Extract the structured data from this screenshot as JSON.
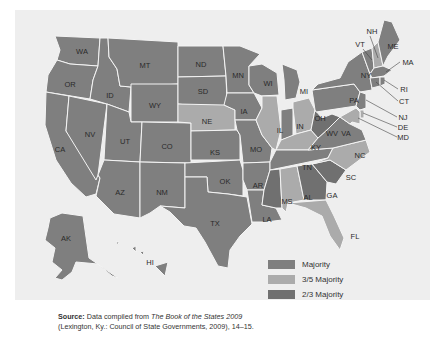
{
  "legend": {
    "items": [
      {
        "label": "Majority",
        "color": "#7f7f7f"
      },
      {
        "label": "3/5 Majority",
        "color": "#ababab"
      },
      {
        "label": "2/3 Majority",
        "color": "#707070"
      }
    ]
  },
  "states": {
    "WA": "Majority",
    "OR": "Majority",
    "CA": "Majority",
    "NV": "Majority",
    "ID": "Majority",
    "MT": "Majority",
    "WY": "Majority",
    "UT": "Majority",
    "AZ": "Majority",
    "CO": "Majority",
    "NM": "Majority",
    "ND": "Majority",
    "SD": "Majority",
    "NE": "3/5 Majority",
    "KS": "Majority",
    "OK": "Majority",
    "TX": "Majority",
    "MN": "Majority",
    "IA": "Majority",
    "MO": "Majority",
    "AR": "Majority",
    "LA": "Majority",
    "WI": "Majority",
    "IL": "3/5 Majority",
    "MI": "Majority",
    "IN": "Majority",
    "OH": "3/5 Majority",
    "KY": "3/5 Majority",
    "TN": "Majority",
    "MS": "2/3 Majority",
    "AL": "3/5 Majority",
    "GA": "2/3 Majority",
    "FL": "3/5 Majority",
    "SC": "2/3 Majority",
    "NC": "3/5 Majority",
    "VA": "Majority",
    "WV": "2/3 Majority",
    "PA": "Majority",
    "NY": "Majority",
    "VT": "Majority",
    "NH": "3/5 Majority",
    "ME": "Majority",
    "MA": "Majority",
    "RI": "Majority",
    "CT": "Majority",
    "NJ": "Majority",
    "DE": "3/5 Majority",
    "MD": "3/5 Majority",
    "AK": "Majority",
    "HI": "Majority"
  },
  "labels": {
    "WA": "WA",
    "OR": "OR",
    "CA": "CA",
    "NV": "NV",
    "ID": "ID",
    "MT": "MT",
    "WY": "WY",
    "UT": "UT",
    "AZ": "AZ",
    "CO": "CO",
    "NM": "NM",
    "ND": "ND",
    "SD": "SD",
    "NE": "NE",
    "KS": "KS",
    "OK": "OK",
    "TX": "TX",
    "MN": "MN",
    "IA": "IA",
    "MO": "MO",
    "AR": "AR",
    "LA": "LA",
    "WI": "WI",
    "IL": "IL",
    "MI": "MI",
    "IN": "IN",
    "OH": "OH",
    "KY": "KY",
    "TN": "TN",
    "MS": "MS",
    "AL": "AL",
    "GA": "GA",
    "FL": "FL",
    "SC": "SC",
    "NC": "NC",
    "VA": "VA",
    "WV": "WV",
    "PA": "PA",
    "NY": "NY",
    "VT": "VT",
    "NH": "NH",
    "ME": "ME",
    "MA": "MA",
    "RI": "RI",
    "CT": "CT",
    "NJ": "NJ",
    "DE": "DE",
    "MD": "MD",
    "AK": "AK",
    "HI": "HI"
  },
  "source": {
    "prefix": "Source:",
    "text1": " Data compiled from ",
    "book": "The Book of the States 2009",
    "line2": "(Lexington, Ky.: Council of State Governments, 2009), 14–15."
  }
}
